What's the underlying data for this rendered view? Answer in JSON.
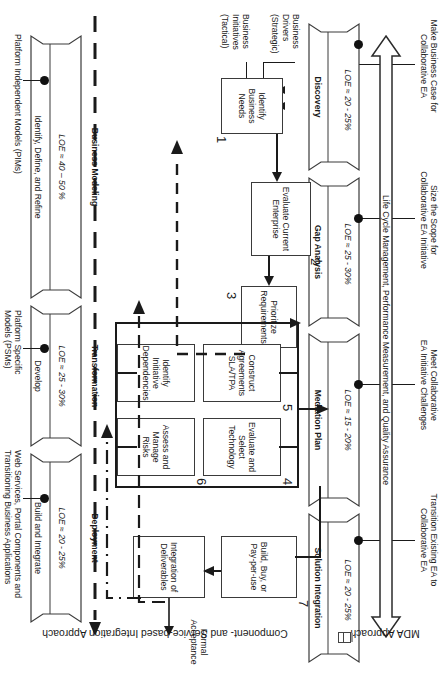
{
  "diagram": {
    "lane_labels": {
      "top": "Component- and Service-based Integration Approach",
      "bottom": "MDA Approach"
    },
    "spanning_arrow_label": "Life Cycle Management, Performance Measurement, and Quality Assurance",
    "goals": [
      "Make Business Case for\nCollaborative EA",
      "Size the Scope for\nCollaborative EA Initiative",
      "Meet Collaborative\nEA Initiative Challenges",
      "Transition Existing EA to\nCollaborative EA"
    ],
    "stages": [
      {
        "name": "Discovery",
        "sub": "",
        "loe": "LOE ≈ 20 - 25%"
      },
      {
        "name": "Gap Analysis",
        "sub": "",
        "loe": "LOE ≈ 25 - 30%"
      },
      {
        "name": "Mediation Plan",
        "sub": "",
        "loe": "LOE ≈ 15 - 20%"
      },
      {
        "name": "Solution Integration",
        "sub": "",
        "loe": "LOE ≈ 20 - 25%"
      }
    ],
    "mda_stages": [
      {
        "name": "Business Modeling",
        "sub": "Identify, Define, and Refine",
        "loe": "LOE ≈ 40 – 50 %",
        "artifact": "Platform Independent Models (PIMs)"
      },
      {
        "name": "Transformation",
        "sub": "Develop",
        "loe": "LOE ≈ 25 - 30%",
        "artifact": "Platform Specific\nModels (PSMs)"
      },
      {
        "name": "Deployment",
        "sub": "Build and Integrate",
        "loe": "LOE ≈ 20 - 25%",
        "artifact": "Web Services, Portal Components and\nTransitioning Business Applications"
      }
    ],
    "inputs": [
      "Business\nDrivers\n(Strategic)",
      "Business\nInitiatives\n(Tactical)"
    ],
    "output": "Formal\nAcceptance",
    "activities": [
      {
        "num": "1",
        "label": "Identify\nBusiness\nNeeds"
      },
      {
        "num": "2",
        "label": "Evaluate Current\nEnterprise"
      },
      {
        "num": "3",
        "label": "Prioritize\nRequirements"
      },
      {
        "num": "4",
        "label": "Evaluate and\nSelect\nTechnology"
      },
      {
        "num": "5",
        "label": "Construct\nAgreements\nSLA/TPA"
      },
      {
        "num": "",
        "label": "Identify\nInitiative\nDependencies"
      },
      {
        "num": "6",
        "label": "Assess and\nManage\nRisks"
      },
      {
        "num": "7",
        "label": "Build, Buy, or\nPay-per-use"
      },
      {
        "num": "",
        "label": "Integration of\nDeliverables"
      }
    ],
    "colors": {
      "ink": "#1a1a1a",
      "box_border": "#3a3a3a",
      "dot": "#111111"
    }
  }
}
